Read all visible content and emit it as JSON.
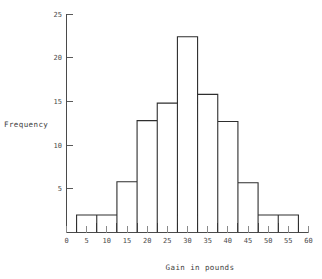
{
  "chart_data": {
    "type": "bar",
    "title": "",
    "subtitle": "",
    "xlabel": "Gain in pounds",
    "ylabel": "Frequency",
    "xlim": [
      0,
      60
    ],
    "ylim": [
      0,
      25
    ],
    "grid": false,
    "legend": null,
    "bin_width": 5,
    "bin_edges": [
      2.5,
      7.5,
      12.5,
      17.5,
      22.5,
      27.5,
      32.5,
      37.5,
      42.5,
      47.5,
      52.5,
      57.5
    ],
    "categories": [
      "2.5-7.5",
      "7.5-12.5",
      "12.5-17.5",
      "17.5-22.5",
      "22.5-27.5",
      "27.5-32.5",
      "32.5-37.5",
      "37.5-42.5",
      "42.5-47.5",
      "47.5-52.5",
      "52.5-57.5"
    ],
    "values": [
      2,
      2,
      5.8,
      12.8,
      14.8,
      22.4,
      15.8,
      12.7,
      5.7,
      2,
      2
    ],
    "x_ticks": [
      0,
      5,
      10,
      15,
      20,
      25,
      30,
      35,
      40,
      45,
      50,
      55,
      60
    ],
    "x_tick_labels": [
      "0",
      "5",
      "10",
      "15",
      "20",
      "25",
      "30",
      "35",
      "40",
      "45",
      "50",
      "55",
      "60"
    ],
    "y_ticks": [
      5,
      10,
      15,
      20,
      25
    ],
    "y_tick_labels": [
      "5",
      "10",
      "15",
      "20",
      "25"
    ],
    "colors": {
      "bar_stroke": "#2e2e2e",
      "bar_fill": "none",
      "axis": "#4a4a4a",
      "text": "#3d3d3d",
      "background": "#ffffff"
    }
  }
}
